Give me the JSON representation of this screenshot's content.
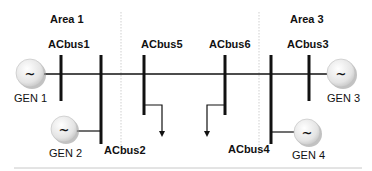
{
  "diagram": {
    "areas": [
      {
        "id": "area1",
        "label": "Area 1"
      },
      {
        "id": "area3",
        "label": "Area 3"
      }
    ],
    "buses": [
      {
        "id": "acbus1",
        "label": "ACbus1"
      },
      {
        "id": "acbus2",
        "label": "ACbus2"
      },
      {
        "id": "acbus5",
        "label": "ACbus5"
      },
      {
        "id": "acbus6",
        "label": "ACbus6"
      },
      {
        "id": "acbus3",
        "label": "ACbus3"
      },
      {
        "id": "acbus4",
        "label": "ACbus4"
      }
    ],
    "generators": [
      {
        "id": "gen1",
        "label": "GEN 1",
        "symbol": "~"
      },
      {
        "id": "gen2",
        "label": "GEN 2",
        "symbol": "~"
      },
      {
        "id": "gen3",
        "label": "GEN 3",
        "symbol": "~"
      },
      {
        "id": "gen4",
        "label": "GEN 4",
        "symbol": "~"
      }
    ],
    "colors": {
      "line": "#111111",
      "divider": "#c8c8c8",
      "gen_fill": "#e6e6e6",
      "gen_shadow": "#9a9a9a"
    }
  }
}
